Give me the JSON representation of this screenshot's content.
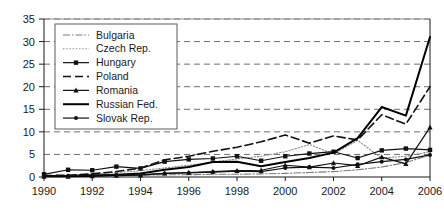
{
  "chart_data": {
    "type": "line",
    "title": "",
    "xlabel": "",
    "ylabel": "",
    "xlim": [
      1990,
      2006
    ],
    "ylim": [
      0,
      35
    ],
    "grid": true,
    "grid_orientation": "horizontal",
    "legend_position": "upper-left-inside",
    "x": [
      1990,
      1991,
      1992,
      1993,
      1994,
      1995,
      1996,
      1997,
      1998,
      1999,
      2000,
      2001,
      2002,
      2003,
      2004,
      2005,
      2006
    ],
    "xticks": [
      1990,
      1992,
      1994,
      1996,
      1998,
      2000,
      2002,
      2004,
      2006
    ],
    "xticklabels": [
      "1990",
      "1992",
      "1994",
      "1996",
      "1998",
      "2000",
      "2002",
      "2004",
      "2006"
    ],
    "yticks": [
      0,
      5,
      10,
      15,
      20,
      25,
      30,
      35
    ],
    "yticklabels": [
      "0",
      "5",
      "10",
      "15",
      "20",
      "25",
      "30",
      "35"
    ],
    "series": [
      {
        "name": "Bulgaria",
        "style": "dash-dot",
        "marker": "none",
        "color": "#7a7a7a",
        "values": [
          0.2,
          0.2,
          0.3,
          0.3,
          0.4,
          0.5,
          0.5,
          0.6,
          0.6,
          0.7,
          0.8,
          1.0,
          1.2,
          1.6,
          2.2,
          3.2,
          4.9
        ]
      },
      {
        "name": "Czech Rep.",
        "style": "dotted",
        "marker": "none",
        "color": "#8a8a8a",
        "values": [
          0.3,
          0.4,
          0.6,
          1.0,
          1.4,
          2.0,
          2.6,
          3.3,
          4.0,
          4.6,
          5.6,
          7.2,
          5.1,
          8.1,
          4.2,
          4.6,
          5.6
        ]
      },
      {
        "name": "Hungary",
        "style": "solid",
        "marker": "square",
        "color": "#111111",
        "values": [
          0.6,
          1.6,
          1.5,
          2.3,
          1.9,
          3.4,
          3.9,
          4.1,
          4.6,
          3.6,
          4.6,
          5.2,
          5.6,
          4.2,
          5.9,
          6.3,
          6.0
        ]
      },
      {
        "name": "Poland",
        "style": "dashed",
        "marker": "none",
        "color": "#111111",
        "values": [
          0.3,
          0.4,
          0.7,
          1.2,
          2.0,
          3.8,
          4.6,
          5.7,
          6.6,
          7.8,
          9.3,
          7.5,
          9.1,
          8.2,
          13.8,
          11.7,
          20.0
        ]
      },
      {
        "name": "Romania",
        "style": "solid",
        "marker": "triangle",
        "color": "#111111",
        "values": [
          0.1,
          0.1,
          0.2,
          0.3,
          0.4,
          0.8,
          1.0,
          1.2,
          1.4,
          1.5,
          2.6,
          2.2,
          3.1,
          2.5,
          4.4,
          2.9,
          11.0
        ]
      },
      {
        "name": "Russian Fed.",
        "style": "solid-thick",
        "marker": "none",
        "color": "#000000",
        "values": [
          0.2,
          0.2,
          0.3,
          0.5,
          0.8,
          1.6,
          2.2,
          3.3,
          3.4,
          2.4,
          3.3,
          4.2,
          5.4,
          8.6,
          15.5,
          13.6,
          31.0
        ]
      },
      {
        "name": "Slovak Rep.",
        "style": "solid",
        "marker": "dot",
        "color": "#111111",
        "values": [
          0.2,
          0.3,
          0.4,
          0.5,
          0.5,
          0.8,
          0.9,
          1.1,
          1.3,
          1.2,
          2.0,
          2.2,
          2.0,
          2.8,
          3.4,
          3.9,
          4.9
        ]
      }
    ]
  },
  "legend": {
    "entries": [
      {
        "label": "Bulgaria"
      },
      {
        "label": "Czech Rep."
      },
      {
        "label": "Hungary"
      },
      {
        "label": "Poland"
      },
      {
        "label": "Romania"
      },
      {
        "label": "Russian Fed."
      },
      {
        "label": "Slovak Rep."
      }
    ]
  }
}
